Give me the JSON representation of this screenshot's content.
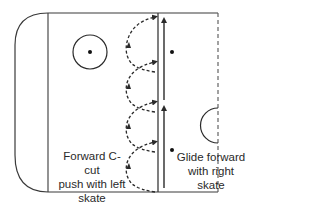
{
  "diagram": {
    "colors": {
      "line": "#3a3a3a",
      "text": "#2a2a2a",
      "background": "#ffffff"
    },
    "labels": {
      "left": "Forward C-cut\npush with left\nskate",
      "right": "Glide forward\nwith right\nskate"
    },
    "elements": {
      "rink_outline": "rounded-corner rink boundary",
      "goal_line": "solid vertical line",
      "faceoff_circle": "circle with center dot",
      "blue_line": "solid vertical line",
      "center_line": "dashed vertical line",
      "center_circle": "half circle at center line",
      "c_cut_paths": 4,
      "glide_arrows": 2,
      "faceoff_dots": 2
    }
  }
}
